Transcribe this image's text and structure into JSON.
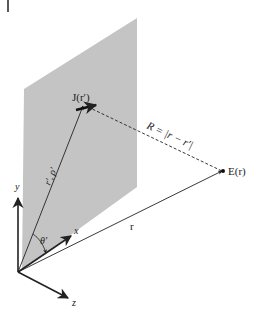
{
  "diagram": {
    "type": "vector-geometry",
    "colors": {
      "plane": "#c4c4c4",
      "stroke": "#222222",
      "background": "#ffffff"
    },
    "labels": {
      "source": "J(r′)",
      "distance": "R = |r − r′|",
      "field_point": "E(r)",
      "source_vector": "r′, ρ′",
      "field_vector": "r",
      "angle": "θ′",
      "axis_x": "x",
      "axis_y": "y",
      "axis_z": "z"
    },
    "icons": {
      "source_arrow": "current-arrow-icon",
      "field_point": "dot-icon"
    }
  }
}
